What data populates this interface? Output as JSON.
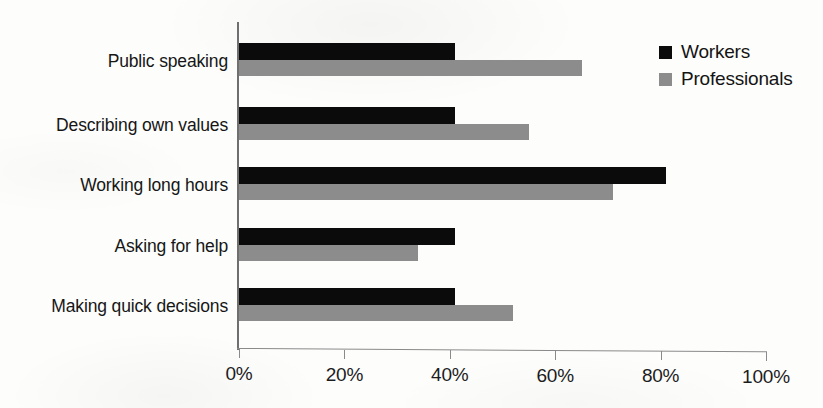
{
  "chart_data": {
    "type": "bar",
    "orientation": "horizontal",
    "title": "",
    "subtitle": "",
    "xlabel": "",
    "ylabel": "",
    "xlim": [
      0,
      100
    ],
    "xticks": [
      0,
      20,
      40,
      60,
      80,
      100
    ],
    "xtick_labels": [
      "0%",
      "20%",
      "40%",
      "60%",
      "80%",
      "100%"
    ],
    "grid": false,
    "legend_position": "top-right",
    "categories": [
      "Public speaking",
      "Describing own values",
      "Working long hours",
      "Asking for help",
      "Making quick decisions"
    ],
    "series": [
      {
        "name": "Workers",
        "color": "#0b0b0b",
        "values": [
          41,
          41,
          81,
          41,
          41
        ]
      },
      {
        "name": "Professionals",
        "color": "#8c8c8c",
        "values": [
          65,
          55,
          71,
          34,
          52
        ]
      }
    ]
  },
  "legend": {
    "items": [
      {
        "label": "Workers",
        "color": "#0b0b0b"
      },
      {
        "label": "Professionals",
        "color": "#8c8c8c"
      }
    ]
  },
  "axis": {
    "x_tick_labels": [
      "0%",
      "20%",
      "40%",
      "60%",
      "80%",
      "100%"
    ]
  },
  "colors": {
    "workers": "#0b0b0b",
    "professionals": "#8c8c8c",
    "axis": "#8a8a8a",
    "text": "#161616",
    "background": "#fdfdfc"
  }
}
